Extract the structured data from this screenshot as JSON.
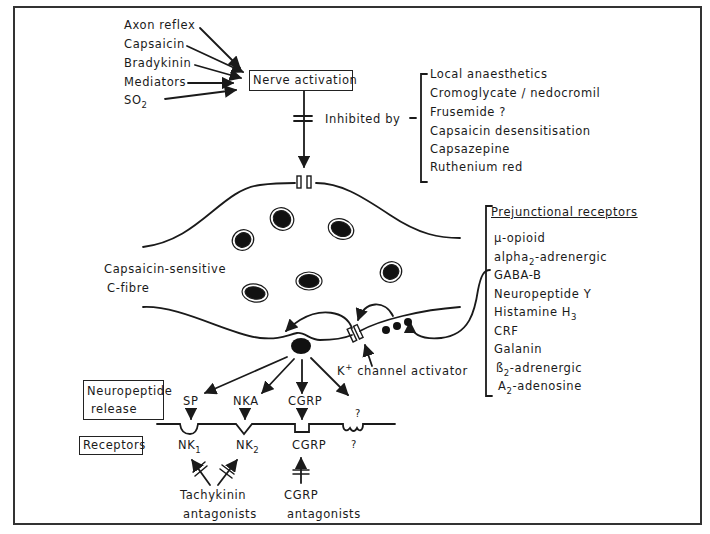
{
  "diagram": {
    "stimuli": [
      {
        "label": "Axon reflex"
      },
      {
        "label": "Capsaicin"
      },
      {
        "label": "Bradykinin"
      },
      {
        "label": "Mediators"
      },
      {
        "label": "SO",
        "sub": "2"
      }
    ],
    "nerve_activation": {
      "label": "Nerve activation"
    },
    "inhibited_by": {
      "label": "Inhibited by",
      "items": [
        "Local anaesthetics",
        "Cromoglycate / nedocromil",
        "Frusemide ?",
        "Capsaicin desensitisation",
        "Capsazepine",
        "Ruthenium red"
      ]
    },
    "fibre": {
      "label_line1": "Capsaicin-sensitive",
      "label_line2": "C-fibre"
    },
    "prejunctional_receptors": {
      "heading": "Prejunctional receptors",
      "items": [
        {
          "main": "μ-opioid"
        },
        {
          "main": "alpha",
          "sub": "2",
          "rest": "-adrenergic"
        },
        {
          "main": "GABA-B"
        },
        {
          "main": "Neuropeptide Y"
        },
        {
          "main": "Histamine H",
          "sub": "3"
        },
        {
          "main": "CRF"
        },
        {
          "main": "Galanin"
        },
        {
          "main": "ß",
          "sub": "2",
          "rest": "-adrenergic"
        },
        {
          "main": "A",
          "sub": "2",
          "rest": "-adenosine"
        }
      ]
    },
    "k_channel": {
      "ion": "K",
      "charge": "+",
      "label": "channel activator"
    },
    "neuropeptide_release_box": {
      "line1": "Neuropeptide",
      "line2": "release"
    },
    "receptors_box": {
      "label": "Receptors"
    },
    "neuropeptides": [
      "SP",
      "NKA",
      "CGRP",
      "?"
    ],
    "receptors": [
      {
        "main": "NK",
        "sub": "1"
      },
      {
        "main": "NK",
        "sub": "2"
      },
      {
        "main": "CGRP"
      },
      {
        "main": "?"
      }
    ],
    "antagonists": [
      {
        "line1": "Tachykinin",
        "line2": "antagonists"
      },
      {
        "line1": "CGRP",
        "line2": "antagonists"
      }
    ],
    "colors": {
      "ink": "#1a1a1a",
      "background": "#ffffff",
      "frame": "#333333"
    }
  }
}
